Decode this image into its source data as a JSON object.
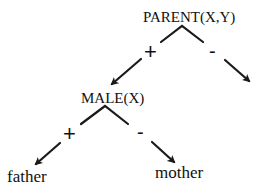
{
  "diagram": {
    "type": "decision-tree",
    "root": {
      "label": "PARENT(X,Y)",
      "branches": [
        {
          "sign": "+",
          "target": "MALE(X)"
        },
        {
          "sign": "-",
          "target": ""
        }
      ]
    },
    "nodes": {
      "parent": {
        "label": "PARENT(X,Y)"
      },
      "male": {
        "label": "MALE(X)"
      }
    },
    "branch_signs": {
      "parent_pos": "+",
      "parent_neg": "-",
      "male_pos": "+",
      "male_neg": "-"
    },
    "leaves": {
      "father": "father",
      "mother": "mother"
    },
    "colors": {
      "ink": "#111111",
      "background": "#ffffff"
    }
  }
}
